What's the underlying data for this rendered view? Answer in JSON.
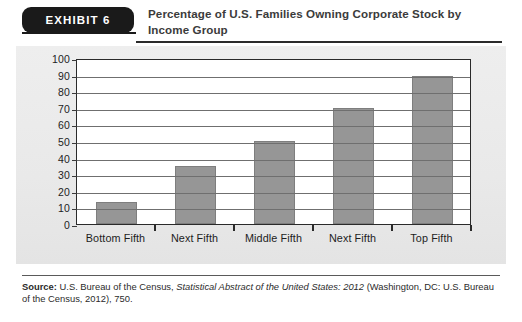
{
  "exhibit": {
    "badge_label": "EXHIBIT 6",
    "title_line1": "Percentage of U.S. Families Owning Corporate Stock by",
    "title_line2": "Income Group"
  },
  "source": {
    "label": "Source:",
    "text_before_italic": " U.S. Bureau of the Census, ",
    "italic_text": "Statistical Abstract of the United States: 2012",
    "text_after_italic": " (Washington, DC: U.S. Bureau of the Census, 2012), 750."
  },
  "colors": {
    "bar_fill": "#969696",
    "bar_border": "#7e7e7e",
    "panel_background": "#ebebeb",
    "plot_background": "#ffffff",
    "axis": "#2a2a2a",
    "gridline": "#6f6f6f",
    "badge_background": "#1a1a1a",
    "title_text": "#3b3b3b"
  },
  "chart_data": {
    "type": "bar",
    "title": "Percentage of U.S. Families Owning Corporate Stock by Income Group",
    "xlabel": "",
    "ylabel": "",
    "categories": [
      "Bottom Fifth",
      "Next Fifth",
      "Middle Fifth",
      "Next Fifth",
      "Top Fifth"
    ],
    "values": [
      13,
      35,
      50,
      70,
      89
    ],
    "ylim": [
      0,
      100
    ],
    "ytick_values": [
      0,
      10,
      20,
      30,
      40,
      50,
      60,
      70,
      80,
      90,
      100
    ],
    "ytick_labels": [
      "0",
      "10",
      "20",
      "30",
      "40",
      "50",
      "60",
      "70",
      "80",
      "90",
      "100"
    ],
    "grid": true,
    "legend": false,
    "legend_position": "none",
    "series": [
      {
        "name": "Percentage of families owning corporate stock",
        "values": [
          13,
          35,
          50,
          70,
          89
        ]
      }
    ]
  }
}
